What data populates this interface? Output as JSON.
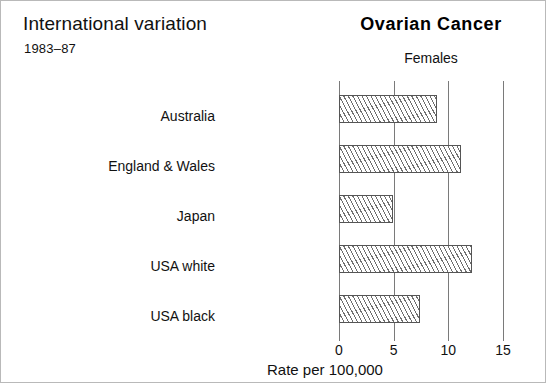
{
  "figure": {
    "heading": "International variation",
    "years": "1983–87",
    "cancer_title": "Ovarian Cancer",
    "sex_label": "Females",
    "border_color": "#b9b9b9"
  },
  "chart_data": {
    "type": "bar",
    "orientation": "horizontal",
    "title": "Ovarian Cancer",
    "subtitle": "Females",
    "xlabel": "Rate per 100,000",
    "ylabel": "",
    "categories": [
      "Australia",
      "England & Wales",
      "Japan",
      "USA white",
      "USA black"
    ],
    "values": [
      9.0,
      11.2,
      4.9,
      12.2,
      7.4
    ],
    "series": [
      {
        "name": "Females",
        "values": [
          9.0,
          11.2,
          4.9,
          12.2,
          7.4
        ]
      }
    ],
    "xlim": [
      0,
      15
    ],
    "xticks": [
      0,
      5,
      10,
      15
    ],
    "xtick_labels": [
      "0",
      "5",
      "10",
      "15"
    ],
    "grid": true,
    "grid_axis": "x",
    "legend": false,
    "bar_fill": "diagonal-hatch",
    "bar_edge_color": "#555555",
    "hatch_color": "#6f6f6f",
    "gridline_color": "#7a7a7a"
  }
}
